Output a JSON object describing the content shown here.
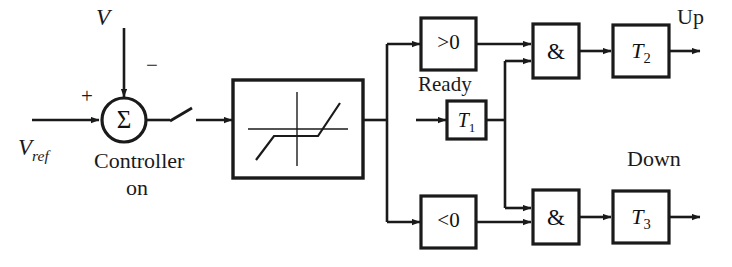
{
  "diagram": {
    "colors": {
      "line": "#1a1a1a",
      "background": "#ffffff",
      "text": "#111111"
    },
    "signals": {
      "reference_input": "V",
      "reference_input_sub": "ref",
      "feedback_input": "V",
      "sum_symbol": "Σ",
      "plus_sign": "+",
      "minus_sign": "−"
    },
    "labels": {
      "controller_line1": "Controller",
      "controller_line2": "on",
      "ready": "Ready",
      "up": "Up",
      "down": "Down"
    },
    "blocks": {
      "nonlinearity": {
        "name": "dead-zone-nonlinearity",
        "text": ""
      },
      "comparator_positive": {
        "name": "greater-than-zero",
        "text": ">0"
      },
      "comparator_negative": {
        "name": "less-than-zero",
        "text": "<0"
      },
      "timer_t1": {
        "name": "timer-t1",
        "text": "T",
        "subscript": "1"
      },
      "timer_t2": {
        "name": "timer-t2",
        "text": "T",
        "subscript": "2"
      },
      "timer_t3": {
        "name": "timer-t3",
        "text": "T",
        "subscript": "3"
      },
      "and_gate_up": {
        "name": "and-gate-up",
        "text": "&"
      },
      "and_gate_down": {
        "name": "and-gate-down",
        "text": "&"
      }
    }
  }
}
